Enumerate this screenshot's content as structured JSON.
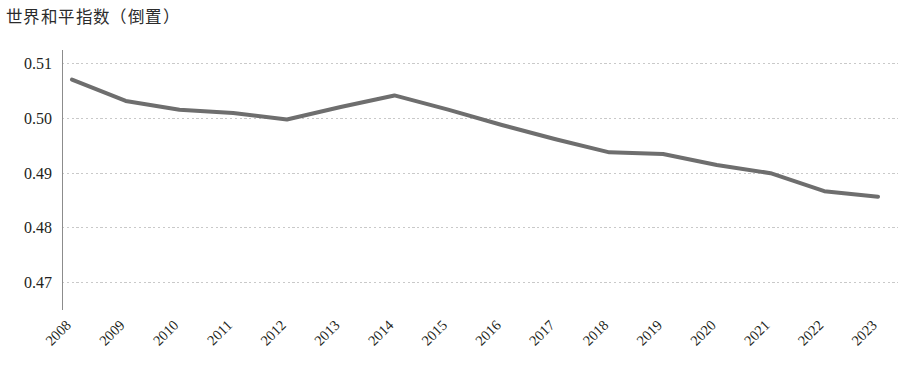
{
  "chart_data": {
    "type": "line",
    "title": "世界和平指数（倒置）",
    "xlabel": "",
    "ylabel": "",
    "categories": [
      "2008",
      "2009",
      "2010",
      "2011",
      "2012",
      "2013",
      "2014",
      "2015",
      "2016",
      "2017",
      "2018",
      "2019",
      "2020",
      "2021",
      "2022",
      "2023"
    ],
    "values": [
      0.5071,
      0.5032,
      0.5016,
      0.501,
      0.4998,
      0.5021,
      0.5042,
      0.5016,
      0.4988,
      0.4962,
      0.4938,
      0.4935,
      0.4915,
      0.49,
      0.4867,
      0.4857
    ],
    "series": [
      {
        "name": "世界和平指数（倒置）",
        "values": [
          0.5071,
          0.5032,
          0.5016,
          0.501,
          0.4998,
          0.5021,
          0.5042,
          0.5016,
          0.4988,
          0.4962,
          0.4938,
          0.4935,
          0.4915,
          0.49,
          0.4867,
          0.4857
        ],
        "color": "#6e6e6e"
      }
    ],
    "ylim": [
      0.465,
      0.5125
    ],
    "yticks": [
      0.51,
      0.5,
      0.49,
      0.48,
      0.47
    ],
    "ytick_labels": [
      "0.51",
      "0.50",
      "0.49",
      "0.48",
      "0.47"
    ],
    "xtick_labels": [
      "2008",
      "2009",
      "2010",
      "2011",
      "2012",
      "2013",
      "2014",
      "2015",
      "2016",
      "2017",
      "2018",
      "2019",
      "2020",
      "2021",
      "2022",
      "2023"
    ],
    "xtick_rotation": 45,
    "grid": true,
    "grid_axis": "y",
    "grid_color": "#c9c9c9",
    "legend": false,
    "legend_position": "none",
    "line_color": "#6e6e6e",
    "background_color": "#ffffff",
    "axis_color": "#8c8c8c"
  }
}
